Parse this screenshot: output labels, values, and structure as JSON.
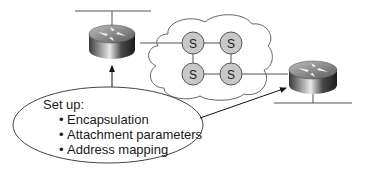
{
  "diagram": {
    "callout": {
      "heading": "Set up:",
      "items": [
        "Encapsulation",
        "Attachment parameters",
        "Address mapping"
      ],
      "bullet": "•"
    },
    "switches": [
      {
        "label": "S"
      },
      {
        "label": "S"
      },
      {
        "label": "S"
      },
      {
        "label": "S"
      }
    ],
    "colors": {
      "switch_fill": "#c8c8c8",
      "line": "#555555",
      "cloud_stroke": "#666666"
    }
  }
}
